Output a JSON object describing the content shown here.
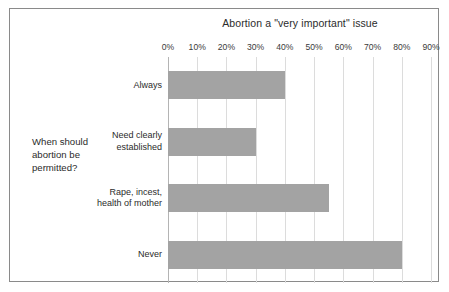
{
  "chart_data": {
    "type": "bar",
    "orientation": "horizontal",
    "title": "Abortion a \"very important\" issue",
    "xlabel": "",
    "ylabel": "When should abortion be permitted?",
    "categories": [
      "Always",
      "Need clearly established",
      "Rape, incest, health of mother",
      "Never"
    ],
    "values": [
      40,
      30,
      55,
      80
    ],
    "value_unit": "%",
    "xlim": [
      0,
      90
    ],
    "xticks": [
      0,
      10,
      20,
      30,
      40,
      50,
      60,
      70,
      80,
      90
    ],
    "xtick_labels": [
      "0%",
      "10%",
      "20%",
      "30%",
      "40%",
      "50%",
      "60%",
      "70%",
      "80%",
      "90%"
    ],
    "grid": true,
    "legend": false,
    "series": [
      {
        "name": "Abortion a \"very important\" issue",
        "values": [
          40,
          30,
          55,
          80
        ]
      }
    ],
    "colors": {
      "bar": "#a3a3a3",
      "gridline": "#dcdcdc",
      "axis": "#b4b4b4",
      "border": "#8a8a8a",
      "text": "#2b2b2b",
      "background": "#ffffff"
    }
  },
  "axis": {
    "question_label": "When should abortion be permitted?",
    "question_line1": "When should",
    "question_line2": "abortion be",
    "question_line3": "permitted?"
  },
  "category_labels": [
    {
      "line1": "Always",
      "line2": ""
    },
    {
      "line1": "Need clearly",
      "line2": "established"
    },
    {
      "line1": "Rape, incest,",
      "line2": "health of mother"
    },
    {
      "line1": "Never",
      "line2": ""
    }
  ]
}
